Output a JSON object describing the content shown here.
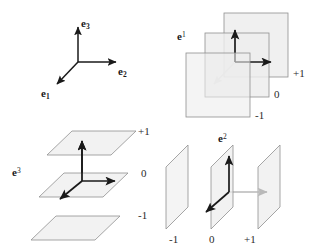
{
  "figure": {
    "background_color": "#ffffff",
    "ink_color": "#1a1a1a",
    "plane_fill": "#ededed",
    "plane_stroke": "#8f8f8f",
    "arrow_black": "#1a1a1a",
    "arrow_gray": "#b9b9b9"
  },
  "panels": {
    "basis_frame": {
      "name": "basis-triad",
      "vectors": [
        {
          "key": "e1",
          "letter": "e",
          "index": "1",
          "direction": "down-left",
          "color": "#1a1a1a"
        },
        {
          "key": "e2",
          "letter": "e",
          "index": "2",
          "direction": "right",
          "color": "#1a1a1a"
        },
        {
          "key": "e3",
          "letter": "e",
          "index": "3",
          "direction": "up",
          "color": "#1a1a1a"
        }
      ],
      "labels": {
        "e1": "e",
        "e1_sub": "1",
        "e2": "e",
        "e2_sub": "2",
        "e3": "e",
        "e3_sub": "3"
      }
    },
    "dual_e1": {
      "name": "dual-covector-e1",
      "label": "e",
      "label_sup": "1",
      "plane_orientation": "frontal-square",
      "level_labels": [
        "+1",
        "0",
        "-1"
      ],
      "levels": [
        {
          "value": "+1",
          "order": "back"
        },
        {
          "value": "0",
          "order": "middle"
        },
        {
          "value": "-1",
          "order": "front"
        }
      ],
      "arrow_colors": {
        "e1": "#b9b9b9",
        "e2": "#1a1a1a",
        "e3": "#1a1a1a"
      }
    },
    "dual_e3": {
      "name": "dual-covector-e3",
      "label": "e",
      "label_sup": "3",
      "plane_orientation": "horizontal",
      "level_labels": [
        "+1",
        "0",
        "-1"
      ],
      "levels": [
        {
          "value": "+1",
          "order": "top"
        },
        {
          "value": "0",
          "order": "middle"
        },
        {
          "value": "-1",
          "order": "bottom"
        }
      ],
      "arrow_colors": {
        "e1": "#1a1a1a",
        "e2": "#1a1a1a",
        "e3": "#1a1a1a"
      }
    },
    "dual_e2": {
      "name": "dual-covector-e2",
      "label": "e",
      "label_sup": "2",
      "plane_orientation": "vertical-slanted",
      "level_labels": [
        "-1",
        "0",
        "+1"
      ],
      "levels": [
        {
          "value": "-1",
          "order": "left"
        },
        {
          "value": "0",
          "order": "middle"
        },
        {
          "value": "+1",
          "order": "right"
        }
      ],
      "arrow_colors": {
        "e1": "#1a1a1a",
        "e2": "#b9b9b9",
        "e3": "#1a1a1a"
      }
    }
  }
}
